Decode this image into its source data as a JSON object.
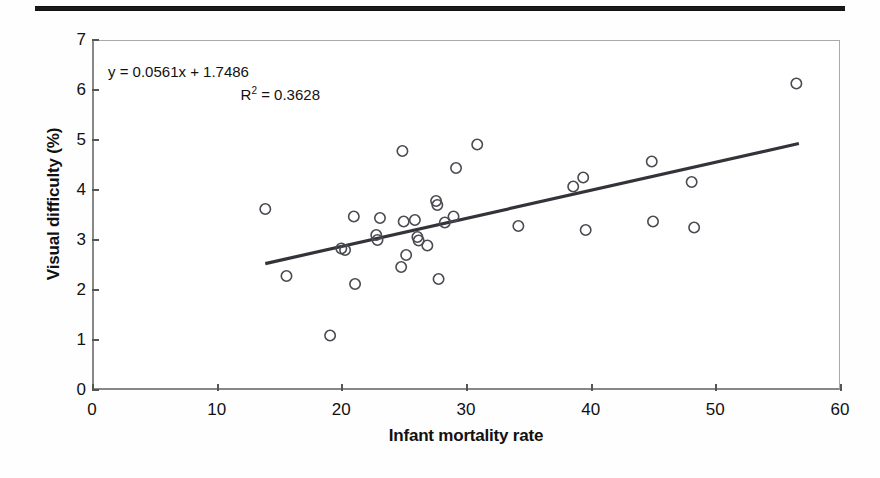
{
  "figure": {
    "top_rule": "horizontal-rule",
    "annotation": {
      "equation": "y = 0.0561x + 1.7486",
      "r_squared_prefix": "R",
      "r_squared_exponent": "2",
      "r_squared_value": "= 0.3628"
    },
    "axis_colors": {
      "marker_stroke": "#4a4a52",
      "trendline": "#33333a",
      "axis": "#888888"
    }
  },
  "chart_data": {
    "type": "scatter",
    "title": "",
    "xlabel": "Infant mortality rate",
    "ylabel": "Visual difficulty (%)",
    "xlim": [
      0,
      60
    ],
    "ylim": [
      0,
      7
    ],
    "xticks": [
      0,
      10,
      20,
      30,
      40,
      50,
      60
    ],
    "yticks": [
      0,
      1,
      2,
      3,
      4,
      5,
      6,
      7
    ],
    "xtick_labels": [
      "0",
      "10",
      "20",
      "30",
      "40",
      "50",
      "60"
    ],
    "ytick_labels": [
      "0",
      "1",
      "2",
      "3",
      "4",
      "5",
      "6",
      "7"
    ],
    "grid": false,
    "legend": null,
    "marker": "open-circle",
    "annotations": [
      "y = 0.0561x + 1.7486",
      "R2 = 0.3628"
    ],
    "trendline": {
      "type": "linear",
      "slope": 0.0561,
      "intercept": 1.7486,
      "r_squared": 0.3628,
      "x_start": 13.9,
      "x_end": 56.7
    },
    "points": [
      {
        "x": 13.9,
        "y": 3.62
      },
      {
        "x": 15.6,
        "y": 2.28
      },
      {
        "x": 19.1,
        "y": 1.09
      },
      {
        "x": 20.0,
        "y": 2.83
      },
      {
        "x": 20.3,
        "y": 2.8
      },
      {
        "x": 21.0,
        "y": 3.47
      },
      {
        "x": 21.1,
        "y": 2.12
      },
      {
        "x": 22.8,
        "y": 3.1
      },
      {
        "x": 22.9,
        "y": 3.0
      },
      {
        "x": 23.1,
        "y": 3.44
      },
      {
        "x": 24.8,
        "y": 2.46
      },
      {
        "x": 24.9,
        "y": 4.78
      },
      {
        "x": 25.0,
        "y": 3.37
      },
      {
        "x": 25.2,
        "y": 2.7
      },
      {
        "x": 25.9,
        "y": 3.4
      },
      {
        "x": 26.1,
        "y": 3.06
      },
      {
        "x": 26.2,
        "y": 2.99
      },
      {
        "x": 26.9,
        "y": 2.89
      },
      {
        "x": 27.6,
        "y": 3.78
      },
      {
        "x": 27.7,
        "y": 3.7
      },
      {
        "x": 27.8,
        "y": 2.22
      },
      {
        "x": 28.3,
        "y": 3.35
      },
      {
        "x": 29.0,
        "y": 3.47
      },
      {
        "x": 29.2,
        "y": 4.44
      },
      {
        "x": 30.9,
        "y": 4.91
      },
      {
        "x": 34.2,
        "y": 3.28
      },
      {
        "x": 38.6,
        "y": 4.07
      },
      {
        "x": 39.4,
        "y": 4.25
      },
      {
        "x": 39.6,
        "y": 3.2
      },
      {
        "x": 44.9,
        "y": 4.57
      },
      {
        "x": 45.0,
        "y": 3.37
      },
      {
        "x": 48.1,
        "y": 4.16
      },
      {
        "x": 48.3,
        "y": 3.25
      },
      {
        "x": 56.5,
        "y": 6.13
      }
    ]
  }
}
